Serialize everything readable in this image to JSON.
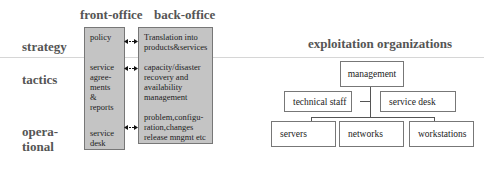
{
  "headings": {
    "front_office": "front-office",
    "back_office": "back-office",
    "exploitation": "exploitation organizations"
  },
  "row_labels": {
    "strategy": "strategy",
    "tactics": "tactics",
    "operational_line1": "opera-",
    "operational_line2": "tional"
  },
  "front_office": {
    "policy": "policy",
    "service_agreements": [
      "service",
      "agree-",
      "ments",
      "&",
      "reports"
    ],
    "service_desk": [
      "service",
      "desk"
    ]
  },
  "back_office": {
    "translation": [
      "Translation into",
      "products&services"
    ],
    "capacity": [
      "capacity/disaster",
      "recovery and",
      "availability",
      "management"
    ],
    "problem": [
      "problem,configu-",
      "ration,changes",
      "release mngmt etc"
    ]
  },
  "org_chart": {
    "root": "management",
    "staff": [
      "technical staff",
      "service desk"
    ],
    "units": [
      "servers",
      "networks",
      "workstations"
    ]
  },
  "colors": {
    "box_fill": "#c4c4c4",
    "heading_text": "#555555"
  }
}
